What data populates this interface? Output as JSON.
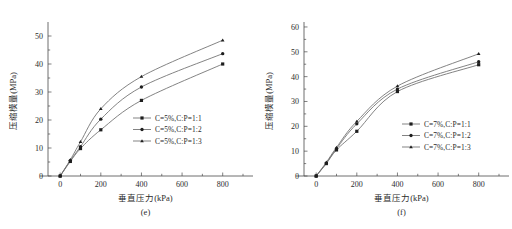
{
  "figure": {
    "panels": [
      {
        "caption": "(e)",
        "xlabel": "垂直压力(kPa)",
        "ylabel": "压缩模量(MPa)",
        "yticks": [
          "0",
          "10",
          "20",
          "30",
          "40",
          "50"
        ],
        "xticks": [
          "0",
          "200",
          "400",
          "600",
          "800"
        ],
        "legend": [
          "C=5%,C:P=1:1",
          "C=5%,C:P=1:2",
          "C=5%,C:P=1:3"
        ]
      },
      {
        "caption": "(f)",
        "xlabel": "垂直压力(kPa)",
        "ylabel": "压缩模量(MPa)",
        "yticks": [
          "0",
          "10",
          "20",
          "30",
          "40",
          "50",
          "60"
        ],
        "xticks": [
          "0",
          "200",
          "400",
          "600",
          "800"
        ],
        "legend": [
          "C=7%,C:P=1:1",
          "C=7%,C:P=1:2",
          "C=7%,C:P=1:3"
        ]
      }
    ]
  },
  "colors": {
    "line": "#6d6d6d",
    "marker": "#1e1e1e",
    "axis": "#4a4a4a",
    "text": "#2b2b2b",
    "background": "#ffffff"
  },
  "chart_data": [
    {
      "type": "line",
      "title": "(e)",
      "xlabel": "垂直压力(kPa)",
      "ylabel": "压缩模量(MPa)",
      "x": [
        0,
        50,
        100,
        200,
        400,
        800
      ],
      "xlim": [
        -60,
        900
      ],
      "ylim": [
        0,
        55
      ],
      "xticks": [
        0,
        200,
        400,
        600,
        800
      ],
      "yticks": [
        0,
        10,
        20,
        30,
        40,
        50
      ],
      "grid": false,
      "legend_position": "center-right",
      "series": [
        {
          "name": "C=5%,C:P=1:1",
          "marker": "square",
          "values": [
            0,
            5.2,
            9.8,
            16.5,
            27.0,
            40.0
          ]
        },
        {
          "name": "C=5%,C:P=1:2",
          "marker": "circle",
          "values": [
            0,
            5.5,
            10.5,
            20.3,
            31.8,
            43.7
          ]
        },
        {
          "name": "C=5%,C:P=1:3",
          "marker": "triangle",
          "values": [
            0,
            5.8,
            12.2,
            24.0,
            35.5,
            48.5
          ]
        }
      ]
    },
    {
      "type": "line",
      "title": "(f)",
      "xlabel": "垂直压力(kPa)",
      "ylabel": "压缩模量(MPa)",
      "x": [
        0,
        50,
        100,
        200,
        400,
        800
      ],
      "xlim": [
        -60,
        900
      ],
      "ylim": [
        0,
        62
      ],
      "xticks": [
        0,
        200,
        400,
        600,
        800
      ],
      "yticks": [
        0,
        10,
        20,
        30,
        40,
        50,
        60
      ],
      "grid": false,
      "legend_position": "center-right",
      "series": [
        {
          "name": "C=7%,C:P=1:1",
          "marker": "square",
          "values": [
            0,
            5.0,
            10.5,
            18.0,
            34.0,
            44.8
          ]
        },
        {
          "name": "C=7%,C:P=1:2",
          "marker": "circle",
          "values": [
            0,
            5.2,
            11.0,
            21.0,
            35.0,
            46.0
          ]
        },
        {
          "name": "C=7%,C:P=1:3",
          "marker": "triangle",
          "values": [
            0,
            5.5,
            11.5,
            22.0,
            36.2,
            49.2
          ]
        }
      ]
    }
  ]
}
